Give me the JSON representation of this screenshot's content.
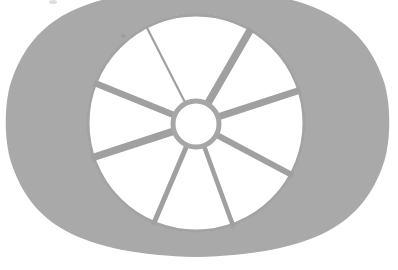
{
  "image": {
    "title": "Apple slicer / wheel corer line drawing",
    "subject_label": "apple-slicer-wheel",
    "width": 398,
    "height": 270,
    "background_color": "#ffffff",
    "body_fill_color": "#a9a9a9",
    "stroke_color": "#a0a0a0",
    "blade_fill_color": "#ffffff",
    "artifact_mark_color": "#d8d8d8"
  },
  "shapes": {
    "outer_body": {
      "name": "hexagonal-handle-body",
      "fill": "#a9a9a9",
      "points": "196,-10 330,16 372,70 390,120 372,175 326,232 196,256 66,232 24,176 6,122 24,68 64,16",
      "corner_radius": 34
    },
    "blade_disc": {
      "name": "blade-disc",
      "center_x": 196,
      "center_y": 123,
      "radius": 109,
      "fill": "#ffffff",
      "rim_stroke": "#a3a3a3",
      "rim_stroke_width": 3
    },
    "hub": {
      "name": "center-hub-ring",
      "center_x": 196,
      "center_y": 124,
      "radius": 24,
      "fill": "#ffffff",
      "stroke": "#a6a6a6",
      "stroke_width": 5
    },
    "spokes": [
      {
        "name": "spoke-up-left-thin",
        "angle_deg": -27,
        "width": 2.2,
        "inner_r": 24,
        "outer_r": 110
      },
      {
        "name": "spoke-up-right",
        "angle_deg": 30,
        "width": 7.5,
        "inner_r": 24,
        "outer_r": 110
      },
      {
        "name": "spoke-right-upper",
        "angle_deg": 72,
        "width": 7.0,
        "inner_r": 24,
        "outer_r": 110
      },
      {
        "name": "spoke-right-lower",
        "angle_deg": 118,
        "width": 6.0,
        "inner_r": 24,
        "outer_r": 110
      },
      {
        "name": "spoke-bottom-right",
        "angle_deg": 160,
        "width": 4.5,
        "inner_r": 24,
        "outer_r": 110
      },
      {
        "name": "spoke-bottom-left",
        "angle_deg": -157,
        "width": 5.0,
        "inner_r": 24,
        "outer_r": 110
      },
      {
        "name": "spoke-left-lower",
        "angle_deg": -108,
        "width": 7.5,
        "inner_r": 24,
        "outer_r": 110
      },
      {
        "name": "spoke-left-upper",
        "angle_deg": -68,
        "width": 6.5,
        "inner_r": 24,
        "outer_r": 110
      }
    ],
    "scan_artifact": {
      "name": "scan-speck-top-left",
      "x": 49,
      "y": 0,
      "width": 8,
      "height": 4
    },
    "scan_artifact_2": {
      "name": "scan-speck-upper-left-interior",
      "x": 121,
      "y": 34,
      "width": 5,
      "height": 4
    }
  },
  "accessibility": {
    "alt_text": "Grayscale line illustration of an apple slicer: a rounded hexagonal handle plate surrounding a circular blade wheel with eight radial cutting blades joined at a small central ring."
  }
}
